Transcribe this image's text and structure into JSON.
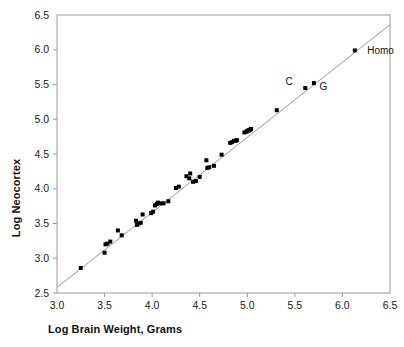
{
  "chart_data": {
    "type": "scatter",
    "title": "",
    "xlabel": "Log Brain Weight, Grams",
    "ylabel": "Log Neocortex",
    "xlim": [
      3.0,
      6.5
    ],
    "ylim": [
      2.5,
      6.5
    ],
    "xticks": [
      "3.0",
      "3.5",
      "4.0",
      "4.5",
      "5.0",
      "5.5",
      "6.0",
      "6.5"
    ],
    "yticks": [
      "2.5",
      "3.0",
      "3.5",
      "4.0",
      "4.5",
      "5.0",
      "5.5",
      "6.0",
      "6.5"
    ],
    "xtick_values": [
      3.0,
      3.5,
      4.0,
      4.5,
      5.0,
      5.5,
      6.0,
      6.5
    ],
    "ytick_values": [
      2.5,
      3.0,
      3.5,
      4.0,
      4.5,
      5.0,
      5.5,
      6.0,
      6.5
    ],
    "grid": false,
    "legend": "none",
    "marker": "square",
    "marker_color": "#000000",
    "marker_size": 4,
    "frame_color": "#9a9a9a",
    "fit_line": {
      "label": "regression-line",
      "color": "#9a9a9a",
      "x_start": 3.0,
      "y_start": 2.58,
      "x_end": 6.5,
      "y_end": 6.36
    },
    "points": [
      {
        "x": 3.25,
        "y": 2.86
      },
      {
        "x": 3.5,
        "y": 3.08
      },
      {
        "x": 3.51,
        "y": 3.2
      },
      {
        "x": 3.53,
        "y": 3.21
      },
      {
        "x": 3.56,
        "y": 3.24
      },
      {
        "x": 3.64,
        "y": 3.4
      },
      {
        "x": 3.68,
        "y": 3.33
      },
      {
        "x": 3.83,
        "y": 3.54
      },
      {
        "x": 3.84,
        "y": 3.48
      },
      {
        "x": 3.86,
        "y": 3.5
      },
      {
        "x": 3.88,
        "y": 3.51
      },
      {
        "x": 3.9,
        "y": 3.63
      },
      {
        "x": 3.99,
        "y": 3.65
      },
      {
        "x": 4.01,
        "y": 3.67
      },
      {
        "x": 4.03,
        "y": 3.76
      },
      {
        "x": 4.05,
        "y": 3.78
      },
      {
        "x": 4.06,
        "y": 3.8
      },
      {
        "x": 4.09,
        "y": 3.79
      },
      {
        "x": 4.12,
        "y": 3.79
      },
      {
        "x": 4.17,
        "y": 3.82
      },
      {
        "x": 4.25,
        "y": 4.01
      },
      {
        "x": 4.28,
        "y": 4.03
      },
      {
        "x": 4.36,
        "y": 4.18
      },
      {
        "x": 4.39,
        "y": 4.15
      },
      {
        "x": 4.4,
        "y": 4.22
      },
      {
        "x": 4.43,
        "y": 4.1
      },
      {
        "x": 4.46,
        "y": 4.11
      },
      {
        "x": 4.5,
        "y": 4.17
      },
      {
        "x": 4.57,
        "y": 4.41
      },
      {
        "x": 4.58,
        "y": 4.3
      },
      {
        "x": 4.6,
        "y": 4.31
      },
      {
        "x": 4.65,
        "y": 4.33
      },
      {
        "x": 4.73,
        "y": 4.49
      },
      {
        "x": 4.82,
        "y": 4.66
      },
      {
        "x": 4.84,
        "y": 4.67
      },
      {
        "x": 4.86,
        "y": 4.69
      },
      {
        "x": 4.88,
        "y": 4.69
      },
      {
        "x": 4.89,
        "y": 4.7
      },
      {
        "x": 4.97,
        "y": 4.81
      },
      {
        "x": 4.99,
        "y": 4.82
      },
      {
        "x": 5.0,
        "y": 4.83
      },
      {
        "x": 5.01,
        "y": 4.84
      },
      {
        "x": 5.02,
        "y": 4.84
      },
      {
        "x": 5.03,
        "y": 4.85
      },
      {
        "x": 5.04,
        "y": 4.86
      },
      {
        "x": 5.31,
        "y": 5.13
      },
      {
        "x": 5.61,
        "y": 5.45
      },
      {
        "x": 5.7,
        "y": 5.52
      },
      {
        "x": 6.13,
        "y": 5.99
      }
    ],
    "annotations": [
      {
        "text": "C",
        "x": 5.44,
        "y": 5.55,
        "anchor": "middle"
      },
      {
        "text": "G",
        "x": 5.8,
        "y": 5.47,
        "anchor": "middle"
      },
      {
        "text": "Homo",
        "x": 6.26,
        "y": 5.99,
        "anchor": "start"
      }
    ]
  }
}
